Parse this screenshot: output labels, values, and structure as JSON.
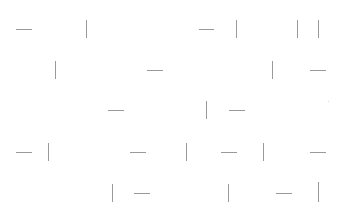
{
  "canvas": {
    "width": 341,
    "height": 223,
    "background": "#ffffff",
    "stroke_color": "#9a9a9a"
  },
  "segments": [
    {
      "o": "h",
      "x": 16,
      "y": 29,
      "len": 16
    },
    {
      "o": "v",
      "x": 86,
      "y": 20,
      "len": 18
    },
    {
      "o": "h",
      "x": 199,
      "y": 29,
      "len": 15
    },
    {
      "o": "v",
      "x": 236,
      "y": 20,
      "len": 18
    },
    {
      "o": "v",
      "x": 297,
      "y": 20,
      "len": 18
    },
    {
      "o": "v",
      "x": 318,
      "y": 20,
      "len": 18
    },
    {
      "o": "v",
      "x": 55,
      "y": 61,
      "len": 18
    },
    {
      "o": "h",
      "x": 147,
      "y": 70,
      "len": 16
    },
    {
      "o": "v",
      "x": 272,
      "y": 61,
      "len": 18
    },
    {
      "o": "h",
      "x": 310,
      "y": 70,
      "len": 16
    },
    {
      "o": "h",
      "x": 108,
      "y": 110,
      "len": 16
    },
    {
      "o": "v",
      "x": 206,
      "y": 101,
      "len": 18
    },
    {
      "o": "h",
      "x": 229,
      "y": 110,
      "len": 16
    },
    {
      "o": "dot",
      "x": 328,
      "y": 101,
      "len": 1
    },
    {
      "o": "h",
      "x": 16,
      "y": 152,
      "len": 16
    },
    {
      "o": "v",
      "x": 48,
      "y": 143,
      "len": 18
    },
    {
      "o": "h",
      "x": 130,
      "y": 152,
      "len": 16
    },
    {
      "o": "v",
      "x": 186,
      "y": 143,
      "len": 18
    },
    {
      "o": "h",
      "x": 221,
      "y": 152,
      "len": 16
    },
    {
      "o": "v",
      "x": 263,
      "y": 143,
      "len": 18
    },
    {
      "o": "h",
      "x": 310,
      "y": 152,
      "len": 16
    },
    {
      "o": "v",
      "x": 112,
      "y": 184,
      "len": 18
    },
    {
      "o": "h",
      "x": 134,
      "y": 193,
      "len": 16
    },
    {
      "o": "v",
      "x": 228,
      "y": 184,
      "len": 18
    },
    {
      "o": "h",
      "x": 276,
      "y": 193,
      "len": 16
    },
    {
      "o": "v",
      "x": 318,
      "y": 182,
      "len": 20
    }
  ]
}
